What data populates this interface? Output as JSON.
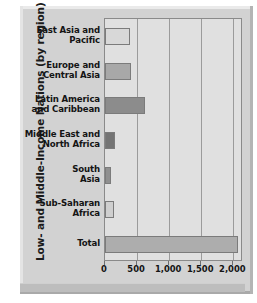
{
  "chart_data": {
    "type": "bar",
    "orientation": "horizontal",
    "title": "",
    "xlabel": "",
    "ylabel": "Low- and Middle-Income Nations (by region)",
    "categories": [
      "East Asia and\nPacific",
      "Europe and\nCentral Asia",
      "Latin America\nand Caribbean",
      "Middle East and\nNorth Africa",
      "South\nAsia",
      "Sub-Saharan\nAfrica",
      "Total"
    ],
    "values": [
      390,
      400,
      620,
      150,
      90,
      140,
      2070
    ],
    "xticks": [
      0,
      500,
      1000,
      1500,
      2000
    ],
    "xtick_labels": [
      "0",
      "500",
      "1,000",
      "1,500",
      "2,000"
    ],
    "xlim": [
      0,
      2150
    ],
    "grid": "vertical",
    "legend": "none",
    "bar_colors": [
      "#d8d8d8",
      "#a8a8a8",
      "#8c8c8c",
      "#747474",
      "#8f8f8f",
      "#cfcfcf",
      "#adadad"
    ]
  },
  "axis": {
    "y_title": "Low- and Middle-Income Nations (by region)"
  },
  "colors": {
    "frame": "#d2d2d2",
    "plot_background": "#e0e0e0",
    "gridline": "#9b9b9b",
    "bar_border": "#7b7b7b",
    "text": "#141414"
  }
}
